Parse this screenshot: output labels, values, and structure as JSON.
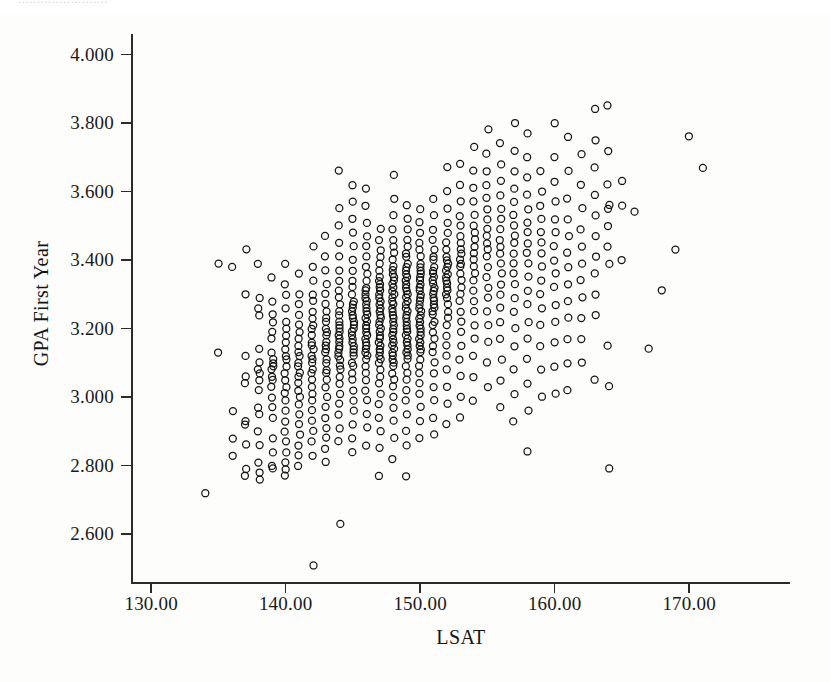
{
  "figure": {
    "top_artifact_text": "........................",
    "background_color": "#fdfdfc",
    "marker_color": "#131313",
    "axis_color": "#2b2b2b"
  },
  "chart_data": {
    "type": "scatter",
    "title": "",
    "subtitle": "",
    "xlabel": "LSAT",
    "ylabel": "GPA First Year",
    "xlim": [
      128.5,
      177.5
    ],
    "ylim": [
      2.46,
      4.06
    ],
    "xticks": [
      130,
      140,
      150,
      160,
      170
    ],
    "xtick_labels": [
      "130.00",
      "140.00",
      "150.00",
      "160.00",
      "170.00"
    ],
    "yticks": [
      2.6,
      2.8,
      3.0,
      3.2,
      3.4,
      3.6,
      3.8,
      4.0
    ],
    "ytick_labels": [
      "2.600",
      "2.800",
      "3.000",
      "3.200",
      "3.400",
      "3.600",
      "3.800",
      "4.000"
    ],
    "grid": false,
    "legend": null,
    "marker": "open-circle",
    "marker_size_px": 7,
    "n_points_approx": 1180,
    "relationship": "positive correlation between LSAT and first-year GPA",
    "annotations": [],
    "columns": [
      {
        "x": 134,
        "values": [
          2.72
        ]
      },
      {
        "x": 135,
        "values": [
          3.39,
          3.13
        ]
      },
      {
        "x": 136,
        "values": [
          3.38,
          2.96,
          2.88,
          2.83
        ]
      },
      {
        "x": 137,
        "values": [
          3.43,
          3.3,
          3.12,
          3.06,
          3.04,
          2.93,
          2.92,
          2.86,
          2.79,
          2.77
        ]
      },
      {
        "x": 138,
        "values": [
          3.39,
          3.29,
          3.26,
          3.24,
          3.14,
          3.1,
          3.08,
          3.07,
          3.05,
          3.02,
          2.97,
          2.95,
          2.9,
          2.86,
          2.81,
          2.78,
          2.76
        ]
      },
      {
        "x": 139,
        "values": [
          3.35,
          3.28,
          3.24,
          3.22,
          3.19,
          3.17,
          3.13,
          3.11,
          3.1,
          3.09,
          3.08,
          3.06,
          3.05,
          3.03,
          3.0,
          2.97,
          2.94,
          2.88,
          2.84,
          2.8,
          2.79
        ]
      },
      {
        "x": 140,
        "values": [
          3.39,
          3.33,
          3.3,
          3.26,
          3.22,
          3.2,
          3.18,
          3.16,
          3.14,
          3.12,
          3.11,
          3.09,
          3.07,
          3.05,
          3.03,
          3.01,
          2.99,
          2.96,
          2.93,
          2.9,
          2.87,
          2.84,
          2.81,
          2.79,
          2.77
        ]
      },
      {
        "x": 141,
        "values": [
          3.36,
          3.3,
          3.27,
          3.24,
          3.21,
          3.19,
          3.17,
          3.15,
          3.13,
          3.12,
          3.1,
          3.09,
          3.07,
          3.06,
          3.04,
          3.02,
          3.0,
          2.98,
          2.95,
          2.92,
          2.89,
          2.86,
          2.83,
          2.8
        ]
      },
      {
        "x": 142,
        "values": [
          3.44,
          3.38,
          3.34,
          3.3,
          3.28,
          3.25,
          3.23,
          3.21,
          3.2,
          3.18,
          3.16,
          3.15,
          3.14,
          3.12,
          3.11,
          3.1,
          3.08,
          3.07,
          3.05,
          3.03,
          3.01,
          2.99,
          2.96,
          2.93,
          2.9,
          2.87,
          2.83,
          2.51
        ]
      },
      {
        "x": 143,
        "values": [
          3.47,
          3.41,
          3.37,
          3.33,
          3.3,
          3.27,
          3.25,
          3.23,
          3.22,
          3.2,
          3.19,
          3.18,
          3.16,
          3.15,
          3.14,
          3.13,
          3.11,
          3.1,
          3.08,
          3.07,
          3.05,
          3.03,
          3.0,
          2.97,
          2.94,
          2.91,
          2.88,
          2.85,
          2.81
        ]
      },
      {
        "x": 144,
        "values": [
          3.66,
          3.55,
          3.5,
          3.45,
          3.41,
          3.37,
          3.34,
          3.31,
          3.29,
          3.27,
          3.25,
          3.24,
          3.22,
          3.21,
          3.2,
          3.19,
          3.18,
          3.17,
          3.16,
          3.15,
          3.14,
          3.13,
          3.12,
          3.11,
          3.09,
          3.08,
          3.06,
          3.04,
          3.01,
          2.98,
          2.95,
          2.91,
          2.87,
          2.63
        ]
      },
      {
        "x": 145,
        "values": [
          3.62,
          3.57,
          3.52,
          3.48,
          3.44,
          3.4,
          3.37,
          3.34,
          3.32,
          3.3,
          3.28,
          3.27,
          3.26,
          3.25,
          3.24,
          3.23,
          3.22,
          3.21,
          3.2,
          3.19,
          3.18,
          3.17,
          3.16,
          3.15,
          3.14,
          3.13,
          3.12,
          3.1,
          3.09,
          3.07,
          3.05,
          3.02,
          2.99,
          2.96,
          2.92,
          2.88,
          2.84
        ]
      },
      {
        "x": 146,
        "values": [
          3.61,
          3.56,
          3.51,
          3.47,
          3.44,
          3.41,
          3.38,
          3.36,
          3.34,
          3.32,
          3.31,
          3.3,
          3.29,
          3.28,
          3.27,
          3.26,
          3.25,
          3.24,
          3.23,
          3.22,
          3.21,
          3.2,
          3.19,
          3.18,
          3.17,
          3.16,
          3.15,
          3.14,
          3.13,
          3.12,
          3.11,
          3.09,
          3.07,
          3.05,
          3.02,
          2.99,
          2.95,
          2.91,
          2.86
        ]
      },
      {
        "x": 147,
        "values": [
          3.49,
          3.46,
          3.43,
          3.41,
          3.39,
          3.37,
          3.35,
          3.34,
          3.33,
          3.32,
          3.31,
          3.3,
          3.29,
          3.28,
          3.27,
          3.26,
          3.25,
          3.24,
          3.23,
          3.22,
          3.21,
          3.2,
          3.19,
          3.18,
          3.17,
          3.16,
          3.15,
          3.14,
          3.13,
          3.12,
          3.11,
          3.1,
          3.08,
          3.06,
          3.04,
          3.01,
          2.98,
          2.94,
          2.9,
          2.85,
          2.77
        ]
      },
      {
        "x": 148,
        "values": [
          3.65,
          3.58,
          3.53,
          3.49,
          3.46,
          3.44,
          3.42,
          3.4,
          3.38,
          3.37,
          3.36,
          3.35,
          3.34,
          3.33,
          3.32,
          3.31,
          3.3,
          3.29,
          3.28,
          3.27,
          3.26,
          3.25,
          3.24,
          3.23,
          3.22,
          3.21,
          3.2,
          3.19,
          3.18,
          3.17,
          3.16,
          3.15,
          3.14,
          3.13,
          3.12,
          3.11,
          3.1,
          3.09,
          3.07,
          3.05,
          3.03,
          3.0,
          2.97,
          2.93,
          2.88,
          2.82
        ]
      },
      {
        "x": 149,
        "values": [
          3.56,
          3.52,
          3.49,
          3.46,
          3.44,
          3.42,
          3.41,
          3.39,
          3.38,
          3.37,
          3.36,
          3.35,
          3.34,
          3.33,
          3.32,
          3.31,
          3.3,
          3.29,
          3.28,
          3.27,
          3.26,
          3.25,
          3.24,
          3.23,
          3.22,
          3.21,
          3.2,
          3.19,
          3.18,
          3.17,
          3.16,
          3.15,
          3.14,
          3.13,
          3.12,
          3.11,
          3.09,
          3.07,
          3.05,
          3.02,
          2.99,
          2.95,
          2.9,
          2.86,
          2.77
        ]
      },
      {
        "x": 150,
        "values": [
          3.55,
          3.51,
          3.48,
          3.45,
          3.43,
          3.41,
          3.39,
          3.38,
          3.37,
          3.36,
          3.35,
          3.34,
          3.33,
          3.32,
          3.31,
          3.3,
          3.29,
          3.28,
          3.27,
          3.26,
          3.25,
          3.24,
          3.23,
          3.22,
          3.21,
          3.2,
          3.19,
          3.18,
          3.17,
          3.16,
          3.15,
          3.14,
          3.13,
          3.11,
          3.09,
          3.07,
          3.04,
          3.01,
          2.97,
          2.93,
          2.88
        ]
      },
      {
        "x": 151,
        "values": [
          3.58,
          3.53,
          3.49,
          3.46,
          3.43,
          3.41,
          3.4,
          3.38,
          3.37,
          3.36,
          3.35,
          3.34,
          3.33,
          3.32,
          3.31,
          3.3,
          3.29,
          3.28,
          3.27,
          3.26,
          3.25,
          3.24,
          3.22,
          3.21,
          3.19,
          3.17,
          3.15,
          3.13,
          3.1,
          3.07,
          3.03,
          2.99,
          2.94,
          2.89
        ]
      },
      {
        "x": 152,
        "values": [
          3.67,
          3.6,
          3.55,
          3.51,
          3.48,
          3.45,
          3.43,
          3.41,
          3.4,
          3.39,
          3.38,
          3.37,
          3.36,
          3.35,
          3.34,
          3.33,
          3.32,
          3.31,
          3.3,
          3.29,
          3.27,
          3.25,
          3.23,
          3.21,
          3.18,
          3.15,
          3.12,
          3.08,
          3.03,
          2.98,
          2.92
        ]
      },
      {
        "x": 153,
        "values": [
          3.68,
          3.62,
          3.57,
          3.53,
          3.5,
          3.47,
          3.45,
          3.43,
          3.42,
          3.4,
          3.39,
          3.38,
          3.36,
          3.34,
          3.32,
          3.3,
          3.28,
          3.25,
          3.22,
          3.19,
          3.15,
          3.11,
          3.06,
          3.0,
          2.94
        ]
      },
      {
        "x": 154,
        "values": [
          3.73,
          3.66,
          3.61,
          3.57,
          3.53,
          3.5,
          3.48,
          3.46,
          3.44,
          3.42,
          3.4,
          3.38,
          3.36,
          3.34,
          3.31,
          3.28,
          3.25,
          3.21,
          3.17,
          3.12,
          3.06,
          2.99
        ]
      },
      {
        "x": 155,
        "values": [
          3.78,
          3.71,
          3.66,
          3.62,
          3.58,
          3.55,
          3.52,
          3.49,
          3.47,
          3.45,
          3.43,
          3.41,
          3.38,
          3.35,
          3.32,
          3.29,
          3.25,
          3.21,
          3.16,
          3.1,
          3.03
        ]
      },
      {
        "x": 156,
        "values": [
          3.74,
          3.68,
          3.63,
          3.59,
          3.55,
          3.52,
          3.49,
          3.46,
          3.44,
          3.42,
          3.39,
          3.36,
          3.33,
          3.3,
          3.26,
          3.22,
          3.17,
          3.11,
          3.05,
          2.97
        ]
      },
      {
        "x": 157,
        "values": [
          3.8,
          3.72,
          3.66,
          3.61,
          3.57,
          3.53,
          3.5,
          3.47,
          3.45,
          3.42,
          3.39,
          3.36,
          3.33,
          3.29,
          3.25,
          3.2,
          3.15,
          3.08,
          3.01,
          2.93
        ]
      },
      {
        "x": 158,
        "values": [
          3.77,
          3.7,
          3.64,
          3.59,
          3.55,
          3.51,
          3.48,
          3.45,
          3.42,
          3.39,
          3.35,
          3.31,
          3.27,
          3.22,
          3.17,
          3.11,
          3.04,
          2.96,
          2.84
        ]
      },
      {
        "x": 159,
        "values": [
          3.66,
          3.6,
          3.56,
          3.52,
          3.48,
          3.45,
          3.42,
          3.38,
          3.34,
          3.3,
          3.26,
          3.21,
          3.15,
          3.08,
          3.0
        ]
      },
      {
        "x": 160,
        "values": [
          3.8,
          3.7,
          3.63,
          3.57,
          3.52,
          3.48,
          3.44,
          3.4,
          3.36,
          3.32,
          3.27,
          3.22,
          3.16,
          3.09,
          3.01
        ]
      },
      {
        "x": 161,
        "values": [
          3.76,
          3.66,
          3.58,
          3.52,
          3.47,
          3.42,
          3.38,
          3.33,
          3.28,
          3.23,
          3.17,
          3.1,
          3.02
        ]
      },
      {
        "x": 162,
        "values": [
          3.71,
          3.62,
          3.55,
          3.49,
          3.44,
          3.39,
          3.34,
          3.29,
          3.23,
          3.17,
          3.1
        ]
      },
      {
        "x": 163,
        "values": [
          3.84,
          3.75,
          3.67,
          3.59,
          3.53,
          3.47,
          3.41,
          3.36,
          3.3,
          3.24,
          3.05
        ]
      },
      {
        "x": 164,
        "values": [
          3.85,
          3.72,
          3.62,
          3.55,
          3.56,
          3.5,
          3.44,
          3.39,
          3.15,
          3.03,
          2.79
        ]
      },
      {
        "x": 165,
        "values": [
          3.63,
          3.56,
          3.4
        ]
      },
      {
        "x": 166,
        "values": [
          3.54
        ]
      },
      {
        "x": 167,
        "values": [
          3.14
        ]
      },
      {
        "x": 168,
        "values": [
          3.31
        ]
      },
      {
        "x": 169,
        "values": [
          3.43
        ]
      },
      {
        "x": 170,
        "values": [
          3.76
        ]
      },
      {
        "x": 171,
        "values": [
          3.67
        ]
      }
    ]
  }
}
